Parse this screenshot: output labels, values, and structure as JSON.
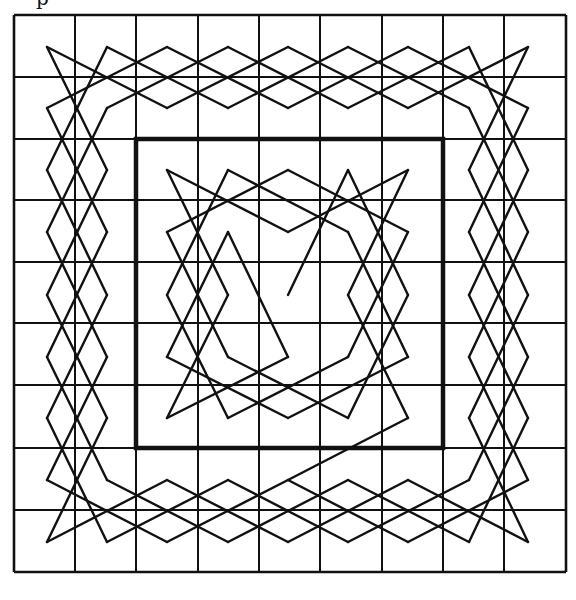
{
  "figure": {
    "caption_fragment": "p",
    "stroke_color": "#111111",
    "background": "#ffffff",
    "grid": {
      "columns": 9,
      "rows": 9,
      "x_lines": [
        14,
        75,
        136,
        198,
        259,
        320,
        382,
        443,
        504,
        566
      ],
      "y_lines": [
        15,
        77,
        139,
        200,
        262,
        323,
        385,
        448,
        510,
        572
      ],
      "cell_centers_x": [
        47,
        107,
        167,
        228,
        288,
        348,
        408,
        469,
        528
      ],
      "cell_centers_y": [
        47,
        108,
        170,
        232,
        295,
        357,
        418,
        480,
        542
      ]
    },
    "inner_square": {
      "col_start": 2,
      "row_start": 2,
      "col_end": 7,
      "row_end": 7,
      "bold": true
    },
    "path_description": "Knight's tour on a 9x9 board: outer 2-cell ring drawn as diamond zigzag bands, inner 5x5 region traced separately, with the tour starting at the center cell",
    "start_cell": [
      4,
      4
    ],
    "inner_edges": [
      [
        [
          4,
          4
        ],
        [
          5,
          2
        ]
      ],
      [
        [
          5,
          2
        ],
        [
          6,
          4
        ]
      ],
      [
        [
          6,
          2
        ],
        [
          5,
          4
        ]
      ],
      [
        [
          6,
          2
        ],
        [
          4,
          3
        ]
      ],
      [
        [
          4,
          3
        ],
        [
          2,
          2
        ]
      ],
      [
        [
          2,
          2
        ],
        [
          3,
          4
        ]
      ],
      [
        [
          3,
          2
        ],
        [
          2,
          4
        ]
      ],
      [
        [
          3,
          2
        ],
        [
          5,
          3
        ]
      ],
      [
        [
          4,
          2
        ],
        [
          2,
          3
        ]
      ],
      [
        [
          4,
          2
        ],
        [
          6,
          3
        ]
      ],
      [
        [
          5,
          3
        ],
        [
          6,
          5
        ]
      ],
      [
        [
          6,
          3
        ],
        [
          5,
          5
        ]
      ],
      [
        [
          2,
          3
        ],
        [
          3,
          5
        ]
      ],
      [
        [
          3,
          3
        ],
        [
          2,
          5
        ]
      ],
      [
        [
          3,
          3
        ],
        [
          4,
          5
        ]
      ],
      [
        [
          4,
          5
        ],
        [
          2,
          6
        ]
      ],
      [
        [
          3,
          5
        ],
        [
          5,
          6
        ]
      ],
      [
        [
          2,
          5
        ],
        [
          4,
          6
        ]
      ],
      [
        [
          2,
          6
        ],
        [
          3,
          4
        ]
      ],
      [
        [
          3,
          6
        ],
        [
          2,
          4
        ]
      ],
      [
        [
          3,
          6
        ],
        [
          5,
          5
        ]
      ],
      [
        [
          4,
          6
        ],
        [
          6,
          5
        ]
      ],
      [
        [
          5,
          6
        ],
        [
          6,
          4
        ]
      ],
      [
        [
          6,
          6
        ],
        [
          5,
          4
        ]
      ],
      [
        [
          6,
          6
        ],
        [
          4,
          7
        ]
      ]
    ]
  }
}
